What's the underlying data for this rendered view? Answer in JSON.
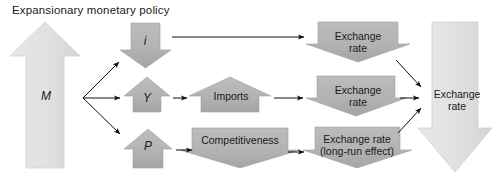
{
  "diagram": {
    "title": "Expansionary monetary policy",
    "colors": {
      "shape_light": "#e2e2e2",
      "shape_mid": "#b4b4b4",
      "shape_dark": "#a8a8a8",
      "outline": "#c8c8c8",
      "arrow_line": "#111111",
      "text": "#1a1a1a",
      "background": "#ffffff"
    },
    "nodes": {
      "money_supply": {
        "label": "M",
        "shape": "up-arrow",
        "tone": "light"
      },
      "interest_rate": {
        "label": "i",
        "shape": "down-arrow",
        "tone": "mid"
      },
      "output": {
        "label": "Y",
        "shape": "up-arrow",
        "tone": "mid"
      },
      "price_level": {
        "label": "P",
        "shape": "up-arrow",
        "tone": "mid"
      },
      "imports": {
        "label": "Imports",
        "shape": "up-arrow",
        "tone": "mid"
      },
      "competitiveness": {
        "label": "Competitiveness",
        "shape": "down-arrow",
        "tone": "mid"
      },
      "exchange_rate_top": {
        "label": "Exchange\nrate",
        "shape": "down-arrow",
        "tone": "mid"
      },
      "exchange_rate_mid": {
        "label": "Exchange\nrate",
        "shape": "down-arrow",
        "tone": "mid"
      },
      "exchange_rate_longrun": {
        "label": "Exchange rate\n(long-run effect)",
        "shape": "down-arrow",
        "tone": "mid"
      },
      "exchange_rate_result": {
        "label": "Exchange\nrate",
        "shape": "down-arrow",
        "tone": "light"
      }
    },
    "connectors": [
      {
        "name": "m-to-i",
        "from": "money_supply",
        "to": "interest_rate"
      },
      {
        "name": "m-to-y",
        "from": "money_supply",
        "to": "output"
      },
      {
        "name": "m-to-p",
        "from": "money_supply",
        "to": "price_level"
      },
      {
        "name": "i-to-exchange-rate-top",
        "from": "interest_rate",
        "to": "exchange_rate_top"
      },
      {
        "name": "y-to-imports",
        "from": "output",
        "to": "imports"
      },
      {
        "name": "imports-to-exchange-rate-mid",
        "from": "imports",
        "to": "exchange_rate_mid"
      },
      {
        "name": "p-to-competitiveness",
        "from": "price_level",
        "to": "competitiveness"
      },
      {
        "name": "competitiveness-to-exchange-rate-longrun",
        "from": "competitiveness",
        "to": "exchange_rate_longrun"
      },
      {
        "name": "exchange-rate-top-to-result",
        "from": "exchange_rate_top",
        "to": "exchange_rate_result"
      },
      {
        "name": "exchange-rate-mid-to-result",
        "from": "exchange_rate_mid",
        "to": "exchange_rate_result"
      },
      {
        "name": "exchange-rate-longrun-to-result",
        "from": "exchange_rate_longrun",
        "to": "exchange_rate_result"
      }
    ]
  }
}
